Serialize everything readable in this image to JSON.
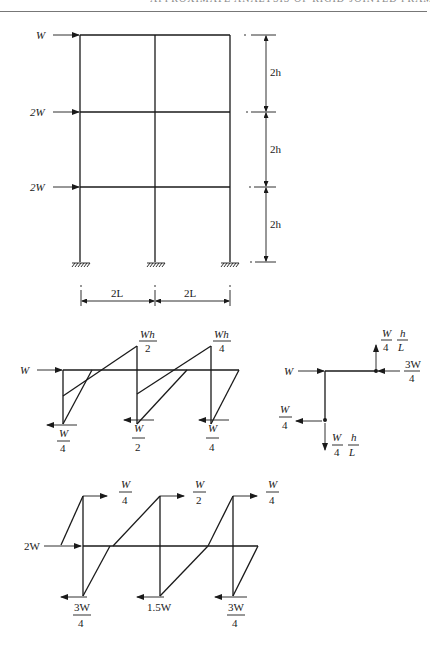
{
  "header": {
    "running_title": "APPROXIMATE ANALYSIS OF RIGID-JOINTED FRAMES"
  },
  "frame": {
    "loads": [
      {
        "label": "W",
        "level": "roof"
      },
      {
        "label": "2W",
        "level": "second floor"
      },
      {
        "label": "2W",
        "level": "first floor"
      }
    ],
    "storey_heights": [
      "2h",
      "2h",
      "2h"
    ],
    "bay_spans": [
      "2L",
      "2L"
    ],
    "supports": [
      "fixed",
      "fixed",
      "fixed"
    ]
  },
  "top_storey_moments": {
    "applied_load": "W",
    "peak_moments": [
      {
        "num": "Wh",
        "den": "2"
      },
      {
        "num": "Wh",
        "den": "4"
      }
    ],
    "column_shears": [
      {
        "num": "W",
        "den": "4"
      },
      {
        "num": "W",
        "den": "2"
      },
      {
        "num": "W",
        "den": "4"
      }
    ]
  },
  "joint_free_body": {
    "applied_load": "W",
    "beam_end_horizontal": {
      "num": "3W",
      "den": "4"
    },
    "beam_end_vertical": {
      "a_num": "W",
      "a_den": "4",
      "b_num": "h",
      "b_den": "L"
    },
    "column_end_horizontal": {
      "num": "W",
      "den": "4"
    },
    "column_end_vertical": {
      "a_num": "W",
      "a_den": "4",
      "b_num": "h",
      "b_den": "L"
    }
  },
  "second_storey_moments": {
    "applied_load": "2W",
    "top_shears": [
      {
        "num": "W",
        "den": "4"
      },
      {
        "num": "W",
        "den": "2"
      },
      {
        "num": "W",
        "den": "4"
      }
    ],
    "bottom_shears": [
      {
        "num": "3W",
        "den": "4"
      },
      {
        "text": "1.5W"
      },
      {
        "num": "3W",
        "den": "4"
      }
    ]
  }
}
